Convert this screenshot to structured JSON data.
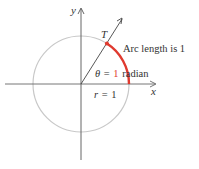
{
  "diagram": {
    "axes": {
      "x_label": "x",
      "y_label": "y"
    },
    "point_label": "T",
    "arc_label": "Arc length is 1",
    "angle": {
      "symbol": "θ",
      "equals": "=",
      "value": "1",
      "unit": "radian"
    },
    "radius_label": {
      "symbol": "r",
      "equals": "=",
      "value": "1"
    },
    "colors": {
      "circle": "#c8c8c8",
      "axis": "#555555",
      "arc": "#e03a2f",
      "point": "#e03a2f",
      "angle_value": "#e03a2f",
      "text": "#333333"
    }
  }
}
